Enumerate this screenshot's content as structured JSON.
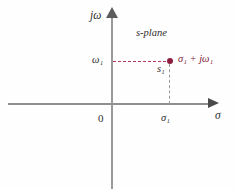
{
  "figure": {
    "region_label": "s-plane",
    "axes": {
      "vertical_label": "jω",
      "horizontal_label": "σ",
      "origin_label": "0"
    },
    "point": {
      "marker_label": "s₁",
      "coordinate_label": "σ₁ + jω₁",
      "imag_tick_label": "ω₁",
      "real_tick_label": "σ₁"
    }
  },
  "chart_data": {
    "type": "scatter",
    "title": "s-plane",
    "xlabel": "σ",
    "ylabel": "jω",
    "grid": false,
    "legend": null,
    "xlim": [
      -1.75,
      2.0
    ],
    "ylim": [
      -1.6,
      1.65
    ],
    "points": [
      {
        "name": "s₁",
        "x": 1.0,
        "y": 0.8,
        "label": "σ₁ + jω₁",
        "color": "#8c1f3d"
      }
    ],
    "xticks": [
      {
        "value": 0.0,
        "label": "0"
      },
      {
        "value": 1.0,
        "label": "σ₁"
      }
    ],
    "yticks": [
      {
        "value": 0.8,
        "label": "ω₁"
      }
    ],
    "annotations": [
      {
        "kind": "dashed-line",
        "description": "horizontal projection from imaginary axis to point s₁",
        "from": [
          0.0,
          0.8
        ],
        "to": [
          1.0,
          0.8
        ],
        "color": "#b03a5b"
      },
      {
        "kind": "dashed-line",
        "description": "vertical projection from point s₁ down to real axis",
        "from": [
          1.0,
          0.8
        ],
        "to": [
          1.0,
          0.0
        ],
        "color": "#9b9b9b"
      },
      {
        "kind": "text",
        "description": "complex plane region label",
        "text": "s-plane",
        "at": [
          0.45,
          1.35
        ]
      }
    ]
  }
}
